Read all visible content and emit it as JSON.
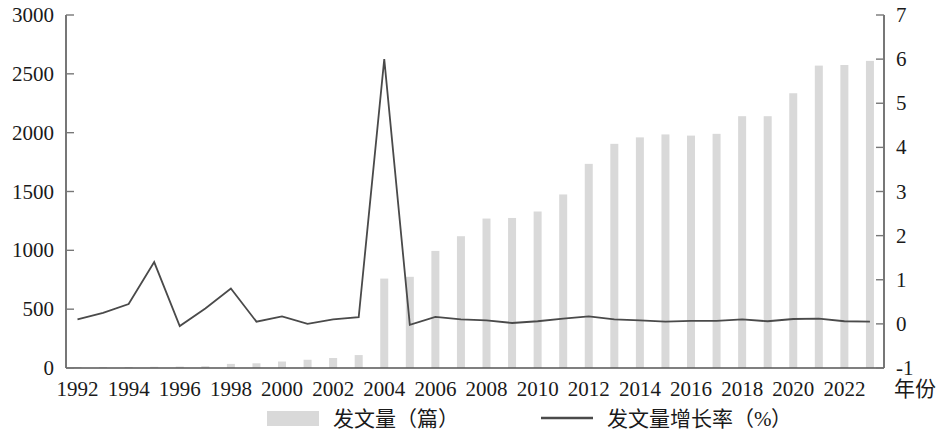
{
  "chart_data": {
    "type": "bar",
    "title": "",
    "xlabel": "年份",
    "ylabel": "",
    "x": [
      1992,
      1993,
      1994,
      1995,
      1996,
      1997,
      1998,
      1999,
      2000,
      2001,
      2002,
      2003,
      2004,
      2005,
      2006,
      2007,
      2008,
      2009,
      2010,
      2011,
      2012,
      2013,
      2014,
      2015,
      2016,
      2017,
      2018,
      2019,
      2020,
      2021,
      2022,
      2023
    ],
    "xticks": [
      "1992",
      "1994",
      "1996",
      "1998",
      "2000",
      "2002",
      "2004",
      "2006",
      "2008",
      "2010",
      "2012",
      "2014",
      "2016",
      "2018",
      "2020",
      "2022"
    ],
    "xtick_values": [
      1992,
      1994,
      1996,
      1998,
      2000,
      2002,
      2004,
      2006,
      2008,
      2010,
      2012,
      2014,
      2016,
      2018,
      2020,
      2022
    ],
    "yticks_left": [
      "0",
      "500",
      "1000",
      "1500",
      "2000",
      "2500",
      "3000"
    ],
    "ytick_values_left": [
      0,
      500,
      1000,
      1500,
      2000,
      2500,
      3000
    ],
    "ylim_left": [
      0,
      3000
    ],
    "yticks_right": [
      "-1",
      "0",
      "1",
      "2",
      "3",
      "4",
      "5",
      "6",
      "7"
    ],
    "ytick_values_right": [
      -1,
      0,
      1,
      2,
      3,
      4,
      5,
      6,
      7
    ],
    "ylim_right": [
      -1,
      7
    ],
    "grid": false,
    "legend_position": "bottom",
    "series": [
      {
        "name": "发文量（篇）",
        "type": "bar",
        "axis": "left",
        "color": "#d9d9d9",
        "values": [
          5,
          6,
          8,
          10,
          12,
          15,
          35,
          40,
          55,
          70,
          85,
          110,
          760,
          775,
          995,
          1120,
          1270,
          1275,
          1330,
          1475,
          1735,
          1905,
          1960,
          1985,
          1975,
          1990,
          2140,
          2140,
          2335,
          2570,
          2575,
          2610
        ]
      },
      {
        "name": "发文量增长率（%）",
        "type": "line",
        "axis": "right",
        "color": "#4a4a4a",
        "values": [
          0.1,
          0.25,
          0.45,
          1.4,
          -0.05,
          0.35,
          0.8,
          0.05,
          0.17,
          0.0,
          0.1,
          0.15,
          6.0,
          -0.02,
          0.16,
          0.1,
          0.08,
          0.02,
          0.06,
          0.12,
          0.17,
          0.1,
          0.08,
          0.05,
          0.07,
          0.07,
          0.1,
          0.06,
          0.11,
          0.12,
          0.06,
          0.05
        ]
      }
    ]
  },
  "legend": {
    "items": [
      {
        "label": "发文量（篇）",
        "marker": "swatch",
        "color": "#d9d9d9"
      },
      {
        "label": "发文量增长率（%）",
        "marker": "line",
        "color": "#4a4a4a"
      }
    ]
  }
}
